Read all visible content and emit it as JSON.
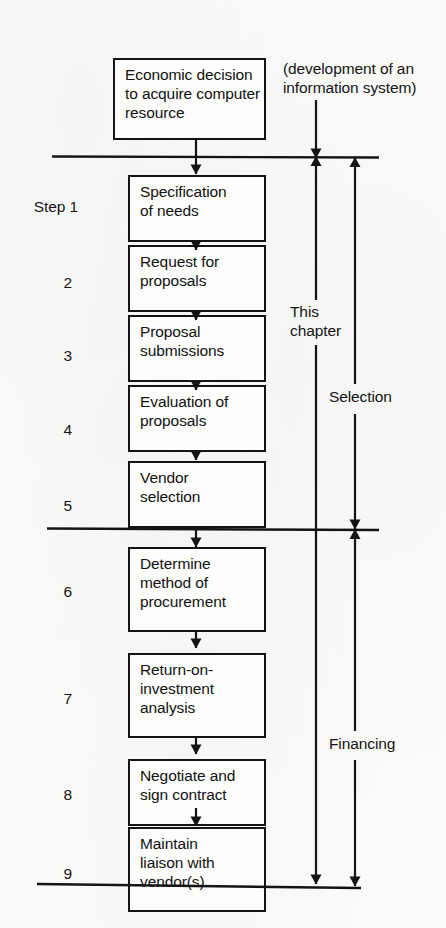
{
  "diagram": {
    "ink_color": "#141414",
    "paper_color": "#fbfbfa",
    "step_word": "Step"
  },
  "annotations": {
    "scope_note": "(development of an\ninformation system)",
    "this_chapter": "This\nchapter",
    "selection": "Selection",
    "financing": "Financing"
  },
  "nodes": [
    {
      "id": "start",
      "step": "",
      "text": "Economic decision\nto acquire computer\nresource"
    },
    {
      "id": "step1",
      "step": "1",
      "text": "Specification\nof needs"
    },
    {
      "id": "step2",
      "step": "2",
      "text": "Request for\nproposals"
    },
    {
      "id": "step3",
      "step": "3",
      "text": "Proposal\nsubmissions"
    },
    {
      "id": "step4",
      "step": "4",
      "text": "Evaluation of\nproposals"
    },
    {
      "id": "step5",
      "step": "5",
      "text": "Vendor\nselection"
    },
    {
      "id": "step6",
      "step": "6",
      "text": "Determine\nmethod of\nprocurement"
    },
    {
      "id": "step7",
      "step": "7",
      "text": "Return-on-\ninvestment\nanalysis"
    },
    {
      "id": "step8",
      "step": "8",
      "text": "Negotiate and\nsign contract"
    },
    {
      "id": "step9",
      "step": "9",
      "text": "Maintain\nliaison with\nvendor(s)"
    }
  ],
  "phases": [
    {
      "id": "selection",
      "label": "Selection",
      "steps": [
        "1",
        "2",
        "3",
        "4",
        "5"
      ]
    },
    {
      "id": "financing",
      "label": "Financing",
      "steps": [
        "6",
        "7",
        "8",
        "9"
      ]
    }
  ]
}
